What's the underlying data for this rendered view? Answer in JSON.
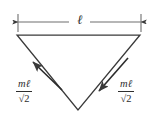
{
  "figure": {
    "background_color": "#ffffff",
    "stroke_color": "#3a3a3a",
    "text_color": "#2e2e2e",
    "width": 157,
    "height": 122
  },
  "dimension": {
    "label": "ℓ",
    "name": "length",
    "orientation": "horizontal",
    "arrow_style": "double-headed",
    "y": 22,
    "x_start": 18,
    "x_end": 141
  },
  "triangle": {
    "name": "inverted-triangle",
    "vertices": [
      {
        "id": "top-left",
        "x": 17,
        "y": 35
      },
      {
        "id": "top-right",
        "x": 140,
        "y": 35
      },
      {
        "id": "apex-bottom",
        "x": 78,
        "y": 110
      }
    ],
    "filled": false
  },
  "vectors": [
    {
      "id": "left-force",
      "numerator": "mℓ",
      "denominator": "√2",
      "expression": "mℓ/√2",
      "direction": "up-left",
      "tail": {
        "x": 62,
        "y": 90
      },
      "tip": {
        "x": 33,
        "y": 62
      }
    },
    {
      "id": "right-force",
      "numerator": "mℓ",
      "denominator": "√2",
      "expression": "mℓ/√2",
      "direction": "down-left",
      "tail": {
        "x": 128,
        "y": 58
      },
      "tip": {
        "x": 99,
        "y": 91
      }
    }
  ]
}
